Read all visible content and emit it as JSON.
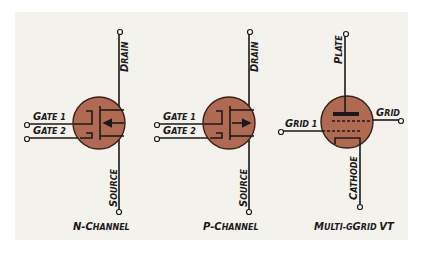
{
  "colors": {
    "panel_bg": "#f4f2ed",
    "device_fill": "#b06a52",
    "line": "#1a1a1a"
  },
  "devices": [
    {
      "name": "N-Channel",
      "caption_first": "N-C",
      "caption_rest": "HANNEL",
      "terminals": {
        "drain": {
          "first": "D",
          "rest": "RAIN"
        },
        "source": {
          "first": "S",
          "rest": "OURCE"
        },
        "gate1": {
          "first": "G",
          "rest": "ATE 1"
        },
        "gate2": {
          "first": "G",
          "rest": "ATE 2"
        }
      },
      "arrow_direction": "inward"
    },
    {
      "name": "P-Channel",
      "caption_first": "P-C",
      "caption_rest": "HANNEL",
      "terminals": {
        "drain": {
          "first": "D",
          "rest": "RAIN"
        },
        "source": {
          "first": "S",
          "rest": "OURCE"
        },
        "gate1": {
          "first": "G",
          "rest": "ATE 1"
        },
        "gate2": {
          "first": "G",
          "rest": "ATE 2"
        }
      },
      "arrow_direction": "outward"
    },
    {
      "name": "Multi-Grid VT",
      "caption_first": "M",
      "caption_rest": "ULTI-G",
      "caption_first2": "",
      "caption_tail": "RID VT",
      "terminals": {
        "plate": {
          "first": "P",
          "rest": "LATE"
        },
        "cathode": {
          "first": "C",
          "rest": "ATHODE"
        },
        "grid1": {
          "first": "G",
          "rest": "RID 1"
        },
        "grid": {
          "first": "G",
          "rest": "RID"
        }
      }
    }
  ]
}
